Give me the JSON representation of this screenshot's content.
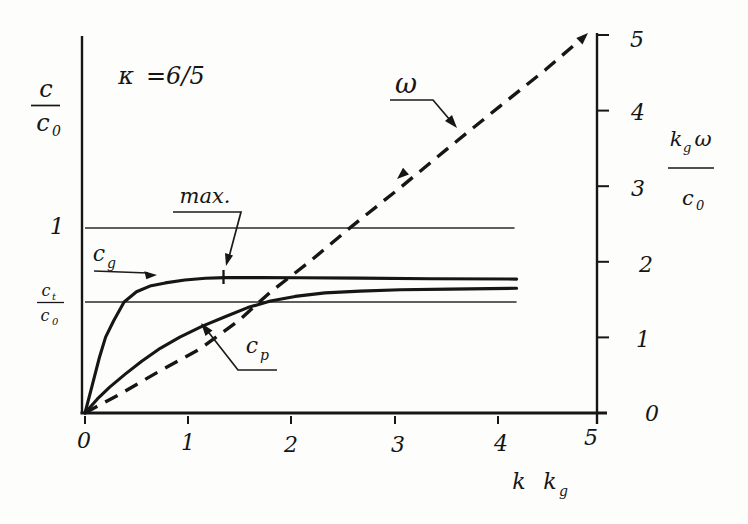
{
  "figure": {
    "annotation": {
      "symbol": "κ",
      "value": "=6/5"
    }
  },
  "axes": {
    "left": {
      "title_num": "c",
      "title_den_base": "c",
      "title_den_sub": "0",
      "tick_one": "1",
      "ct_num_base": "c",
      "ct_num_sub": "t",
      "ct_den_base": "c",
      "ct_den_sub": "0"
    },
    "bottom": {
      "ticks": [
        "0",
        "1",
        "2",
        "3",
        "4",
        "5"
      ],
      "title_k": "k",
      "title_kg_base": "k",
      "title_kg_sub": "g"
    },
    "right": {
      "ticks": [
        "5",
        "4",
        "3",
        "2",
        "1",
        "0"
      ],
      "title_num_base": "k",
      "title_num_sub": "g",
      "title_num_omega": "ω",
      "title_den_base": "c",
      "title_den_sub": "0"
    }
  },
  "curve_labels": {
    "cg_base": "c",
    "cg_sub": "g",
    "cp_base": "c",
    "cp_sub": "p",
    "omega": "ω",
    "max": "max."
  },
  "chart_data": {
    "type": "line",
    "xlabel": "k kg",
    "ylabel_left": "c / c0",
    "ylabel_right": "kg ω / c0",
    "xlim": [
      0,
      5
    ],
    "ylim_left": [
      0,
      2.03
    ],
    "ylim_right": [
      0,
      5
    ],
    "grid": false,
    "legend": "inline-labels-with-leader-arrows",
    "annotations": [
      "κ =6/5",
      "max. (marked at k kg ≈ 1.35 on cg curve)"
    ],
    "reference_lines": [
      {
        "name": "c/c0 = 1",
        "y": 1.0,
        "x_start": 0,
        "x_end": 4.17
      },
      {
        "name": "ct/c0",
        "y": 0.6,
        "x_start": 0,
        "x_end": 4.19
      }
    ],
    "series": [
      {
        "name": "c_g",
        "axis": "left",
        "style": "solid",
        "x": [
          0,
          0.07,
          0.14,
          0.2,
          0.28,
          0.38,
          0.5,
          0.63,
          0.78,
          0.97,
          1.17,
          1.36,
          1.7,
          2.09,
          2.67,
          3.35,
          4.19
        ],
        "y": [
          0,
          0.15,
          0.3,
          0.41,
          0.5,
          0.6,
          0.655,
          0.686,
          0.703,
          0.719,
          0.728,
          0.732,
          0.732,
          0.731,
          0.729,
          0.726,
          0.724
        ]
      },
      {
        "name": "c_p",
        "axis": "left",
        "style": "solid",
        "x": [
          0,
          0.12,
          0.24,
          0.39,
          0.55,
          0.73,
          0.92,
          1.14,
          1.36,
          1.58,
          1.8,
          2.04,
          2.33,
          2.67,
          3.06,
          3.54,
          4.19
        ],
        "y": [
          0,
          0.076,
          0.14,
          0.21,
          0.28,
          0.35,
          0.41,
          0.47,
          0.52,
          0.57,
          0.605,
          0.63,
          0.649,
          0.659,
          0.666,
          0.67,
          0.674
        ]
      },
      {
        "name": "omega",
        "axis": "right",
        "style": "dashed",
        "x": [
          0,
          0.34,
          0.73,
          1.12,
          1.5,
          1.8,
          2.18,
          2.59,
          3.06,
          3.54,
          4.03,
          4.47,
          4.83
        ],
        "y": [
          0,
          0.25,
          0.56,
          0.85,
          1.23,
          1.6,
          2.0,
          2.47,
          2.98,
          3.52,
          4.06,
          4.54,
          4.96
        ]
      }
    ]
  }
}
